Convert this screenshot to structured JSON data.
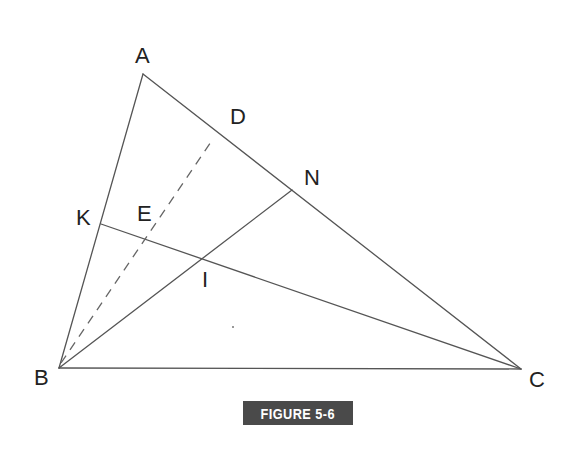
{
  "diagram": {
    "type": "triangle-geometry",
    "points": {
      "A": {
        "label": "A",
        "x": 143,
        "y": 74
      },
      "B": {
        "label": "B",
        "x": 59,
        "y": 368
      },
      "C": {
        "label": "C",
        "x": 521,
        "y": 369
      },
      "D": {
        "label": "D",
        "x": 222,
        "y": 128
      },
      "N": {
        "label": "N",
        "x": 292,
        "y": 190
      },
      "K": {
        "label": "K",
        "x": 101,
        "y": 224
      },
      "I": {
        "label": "I",
        "x": 203,
        "y": 257
      },
      "E": {
        "label": "E",
        "x": 140,
        "y": 231
      }
    },
    "segments": [
      {
        "from": "A",
        "to": "B",
        "style": "solid"
      },
      {
        "from": "A",
        "to": "C",
        "style": "solid"
      },
      {
        "from": "B",
        "to": "C",
        "style": "solid"
      },
      {
        "from": "B",
        "to": "N",
        "style": "solid"
      },
      {
        "from": "K",
        "to": "C",
        "style": "solid"
      },
      {
        "from": "B",
        "to": "D",
        "style": "dashed"
      }
    ],
    "labels": [
      {
        "text": "A",
        "x": 135,
        "y": 63
      },
      {
        "text": "D",
        "x": 230,
        "y": 124
      },
      {
        "text": "N",
        "x": 304,
        "y": 185
      },
      {
        "text": "K",
        "x": 76,
        "y": 225
      },
      {
        "text": "E",
        "x": 137,
        "y": 221
      },
      {
        "text": "I",
        "x": 202,
        "y": 287
      },
      {
        "text": "B",
        "x": 34,
        "y": 385
      },
      {
        "text": "C",
        "x": 529,
        "y": 387
      }
    ],
    "caption": "FIGURE 5-6"
  },
  "colors": {
    "line": "#555555",
    "caption_bg": "#4a4a4a",
    "caption_text": "#ffffff"
  }
}
